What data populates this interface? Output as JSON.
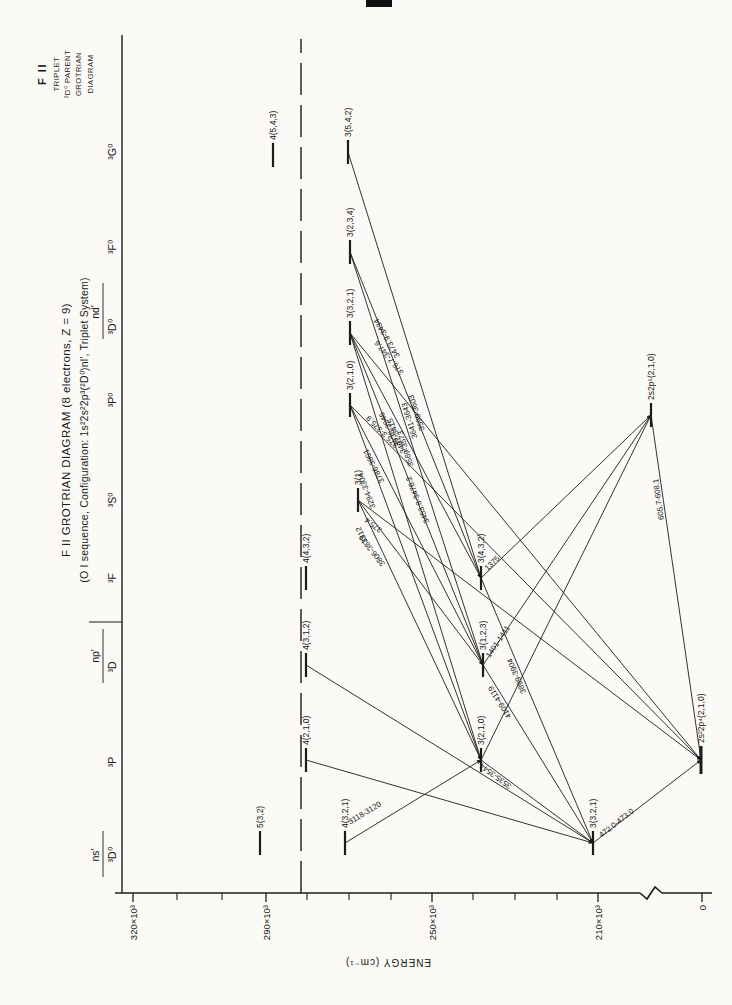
{
  "corner": [
    "F II",
    "TRIPLET",
    "²D⁰ PARENT",
    "GROTRIAN",
    "DIAGRAM"
  ],
  "title": {
    "line1": "F II GROTRIAN DIAGRAM (8 electrons, Z = 9)",
    "line2": "(O I sequence, Configuration: 1s²2s²2p³(²D⁰)nl′, Triplet System)"
  },
  "chart_data": {
    "type": "scatter",
    "subtype": "grotrian-energy-level-diagram",
    "ylabel": "ENERGY (cm⁻¹)",
    "ylim_cm": [
      0,
      330000
    ],
    "axis_break_cm": [
      5000,
      205000
    ],
    "grid": false,
    "axis": {
      "x": 112,
      "top": 115,
      "bottom": 712,
      "break_top": 640,
      "break_bottom": 662,
      "major_ticks": [
        {
          "label": "320×10³",
          "y": 133
        },
        {
          "label": "290×10³",
          "y": 266
        },
        {
          "label": "250×10³",
          "y": 432
        },
        {
          "label": "210×10³",
          "y": 598
        },
        {
          "label": "0",
          "y": 702
        }
      ],
      "minor_ticks": [
        177,
        222,
        307,
        349,
        391,
        473,
        515,
        557
      ],
      "energy_label": "ENERGY (cm⁻¹)"
    },
    "rule": {
      "y": 122,
      "x1": 112,
      "x2": 970
    },
    "separator_tick": {
      "x": 383,
      "y1": 89,
      "y2": 122
    },
    "limit_line": {
      "y": 301,
      "x1": 112,
      "x2": 966,
      "style": "dashed",
      "meaning": "ionization limit"
    },
    "columns": {
      "groups": [
        {
          "text": "ns′",
          "x": 150,
          "y": 99,
          "u1": 128,
          "u2": 174
        },
        {
          "text": "np′",
          "x": 349,
          "y": 99,
          "u1": 322,
          "u2": 376
        },
        {
          "text": "nd′",
          "x": 693,
          "y": 99,
          "u1": 666,
          "u2": 722
        }
      ],
      "terms": [
        {
          "text": "³D⁰",
          "x": 150,
          "y": 116
        },
        {
          "text": "³P",
          "x": 243,
          "y": 116
        },
        {
          "text": "³D",
          "x": 338,
          "y": 116
        },
        {
          "text": "³F",
          "x": 427,
          "y": 116
        },
        {
          "text": "³S⁰",
          "x": 505,
          "y": 116
        },
        {
          "text": "³P⁰",
          "x": 605,
          "y": 116
        },
        {
          "text": "³D⁰",
          "x": 678,
          "y": 116
        },
        {
          "text": "³F⁰",
          "x": 758,
          "y": 116
        },
        {
          "text": "³G⁰",
          "x": 853,
          "y": 116
        }
      ]
    },
    "levels": [
      {
        "id": "ns5s",
        "label": "5(3,2)",
        "column": "ns′ ³D⁰",
        "x": 162,
        "y": 260,
        "energy_1e3": 291
      },
      {
        "id": "ns4s",
        "label": "4(3,2,1)",
        "column": "ns′ ³D⁰",
        "x": 162,
        "y": 345,
        "energy_1e3": 271
      },
      {
        "id": "ns3s",
        "label": "3(3,2,1)",
        "column": "ns′ ³D⁰",
        "x": 162,
        "y": 593,
        "energy_1e3": 211
      },
      {
        "id": "pP4",
        "label": "4(2,1,0)",
        "column": "np′ ³P",
        "x": 245,
        "y": 306,
        "energy_1e3": 280
      },
      {
        "id": "pP3",
        "label": "3(2,1,0)",
        "column": "np′ ³P",
        "x": 245,
        "y": 481,
        "energy_1e3": 238
      },
      {
        "id": "pD4",
        "label": "4(3,1,2)",
        "column": "np′ ³D",
        "x": 340,
        "y": 306,
        "energy_1e3": 280
      },
      {
        "id": "pD3",
        "label": "3(1,2,3)",
        "column": "np′ ³D",
        "x": 340,
        "y": 483,
        "energy_1e3": 238
      },
      {
        "id": "pF4",
        "label": "4(4,3,2)",
        "column": "np′ ³F",
        "x": 427,
        "y": 306,
        "energy_1e3": 280
      },
      {
        "id": "pF3",
        "label": "3(4,3,2)",
        "column": "np′ ³F",
        "x": 427,
        "y": 481,
        "energy_1e3": 238
      },
      {
        "id": "dS3",
        "label": "3(1)",
        "column": "nd′ ³S⁰",
        "x": 505,
        "y": 358,
        "energy_1e3": 268
      },
      {
        "id": "dP3",
        "label": "3(2,1,0)",
        "column": "nd′ ³P⁰",
        "x": 600,
        "y": 350,
        "energy_1e3": 270
      },
      {
        "id": "dD3",
        "label": "3(3,2,1)",
        "column": "nd′ ³D⁰",
        "x": 672,
        "y": 350,
        "energy_1e3": 270
      },
      {
        "id": "dF3",
        "label": "3(2,3,4)",
        "column": "nd′ ³F⁰",
        "x": 753,
        "y": 350,
        "energy_1e3": 270
      },
      {
        "id": "fG4",
        "label": "4(5,4,3)",
        "column": "³G⁰",
        "x": 850,
        "y": 273,
        "energy_1e3": 288
      },
      {
        "id": "dG3",
        "label": "3(5,4,2)",
        "column": "³G⁰",
        "x": 853,
        "y": 348,
        "energy_1e3": 270
      },
      {
        "id": "p5",
        "label": "2s2p⁵(2,1,0)",
        "column": "",
        "x": 590,
        "y": 651,
        "energy_1e3": 165
      },
      {
        "id": "gnd",
        "label": "2s²2p⁴(2,1,0)",
        "column": "",
        "x": 245,
        "y": 701,
        "hw": 14,
        "thick": 3,
        "energy_1e3": 0
      }
    ],
    "transitions": [
      {
        "from": "dD3",
        "to": "gnd",
        "label": "376.7-347.6",
        "lx": 649,
        "ly": 391,
        "rot": -39
      },
      {
        "from": "dP3",
        "to": "gnd",
        "label": "375.3-375.9",
        "lx": 575,
        "ly": 384,
        "rot": -45
      },
      {
        "from": "dS3",
        "to": "gnd",
        "label": "375.4",
        "lx": 482,
        "ly": 375,
        "rot": -53
      },
      {
        "from": "p5",
        "to": "gnd",
        "label": "605.7-608.1",
        "lx": 506,
        "ly": 661,
        "rot": -8
      },
      {
        "from": "ns3s",
        "to": "gnd",
        "label": "472.0-473.0",
        "lx": 180,
        "ly": 618,
        "rot": 52
      },
      {
        "from": "pP3",
        "to": "p5",
        "label": "",
        "lx": 0,
        "ly": 0,
        "rot": 0
      },
      {
        "from": "pD3",
        "to": "p5",
        "label": "1401-1411",
        "lx": 362,
        "ly": 500,
        "rot": 34
      },
      {
        "from": "pF3",
        "to": "p5",
        "label": "1375",
        "lx": 440,
        "ly": 494,
        "rot": 46
      },
      {
        "from": "pP3",
        "to": "ns3s",
        "label": "3535-3544",
        "lx": 231,
        "ly": 497,
        "rot": -54
      },
      {
        "from": "pD3",
        "to": "ns3s",
        "label": "4109-4119",
        "lx": 304,
        "ly": 502,
        "rot": -32
      },
      {
        "from": "pF3",
        "to": "ns3s",
        "label": "3899-3904",
        "lx": 330,
        "ly": 519,
        "rot": -23
      },
      {
        "from": "ns4s",
        "to": "pP3",
        "label": "3118-3120",
        "lx": 190,
        "ly": 366,
        "rot": 59
      },
      {
        "from": "dG3",
        "to": "pF3",
        "label": "3641-3643",
        "lx": 585,
        "ly": 412,
        "rot": -17
      },
      {
        "from": "dF3",
        "to": "pD3",
        "label": "3599-3603",
        "lx": 593,
        "ly": 419,
        "rot": -18
      },
      {
        "from": "dF3",
        "to": "pF3",
        "label": "3453.8-3476.2",
        "lx": 506,
        "ly": 420,
        "rot": -22
      },
      {
        "from": "dD3",
        "to": "pP3",
        "label": "3569-3573",
        "lx": 557,
        "ly": 408,
        "rot": -17
      },
      {
        "from": "dD3",
        "to": "pD3",
        "label": "3407-3415",
        "lx": 570,
        "ly": 399,
        "rot": -22
      },
      {
        "from": "dD3",
        "to": "pF3",
        "label": "3935-3946",
        "lx": 577,
        "ly": 392,
        "rot": -28
      },
      {
        "from": "dP3",
        "to": "pP3",
        "label": "3294-3304",
        "lx": 515,
        "ly": 369,
        "rot": -20
      },
      {
        "from": "dP3",
        "to": "pD3",
        "label": "3786-3801",
        "lx": 540,
        "ly": 376,
        "rot": -27
      },
      {
        "from": "dS3",
        "to": "pP3",
        "label": "3312",
        "lx": 471,
        "ly": 364,
        "rot": -26
      },
      {
        "from": "dS3",
        "to": "pD3",
        "label": "3806-3819",
        "lx": 456,
        "ly": 374,
        "rot": -38
      },
      {
        "from": "pP4",
        "to": "ns3s",
        "label": "",
        "lx": 0,
        "ly": 0,
        "rot": 0
      },
      {
        "from": "pD4",
        "to": "ns3s",
        "label": "",
        "lx": 0,
        "ly": 0,
        "rot": 0
      }
    ],
    "extra_labels": [
      {
        "text": "3473.9-3434",
        "x": 668,
        "y": 389,
        "rot": -30
      }
    ],
    "artifacts": [
      {
        "x": 998,
        "y": 366,
        "w": 7,
        "h": 26
      }
    ]
  }
}
